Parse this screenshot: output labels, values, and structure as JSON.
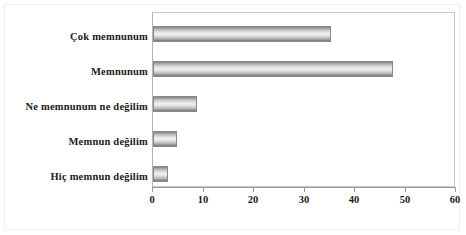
{
  "chart_data": {
    "type": "bar",
    "orientation": "horizontal",
    "title": "",
    "subtitle": "",
    "xlabel": "",
    "ylabel": "",
    "categories": [
      "Çok memnunum",
      "Memnunum",
      "Ne memnunum ne değilim",
      "Memnun değilim",
      "Hiç memnun değilim"
    ],
    "values": [
      35.2,
      47.5,
      8.7,
      4.8,
      2.9
    ],
    "series": [
      {
        "name": "",
        "values": [
          35.2,
          47.5,
          8.7,
          4.8,
          2.9
        ]
      }
    ],
    "xlim": [
      0,
      60
    ],
    "xticks": [
      0,
      10,
      20,
      30,
      40,
      50,
      60
    ],
    "xtick_labels": [
      "0",
      "10",
      "20",
      "30",
      "40",
      "50",
      "60"
    ],
    "grid": false,
    "legend": false,
    "legend_position": "none",
    "bar_fill": "#d9d9d9",
    "bar_edge": "#8a8a8a",
    "plot_background": "#ffffff",
    "frame_color": "#c8c8c8",
    "text_color": "#1a1a1a"
  }
}
